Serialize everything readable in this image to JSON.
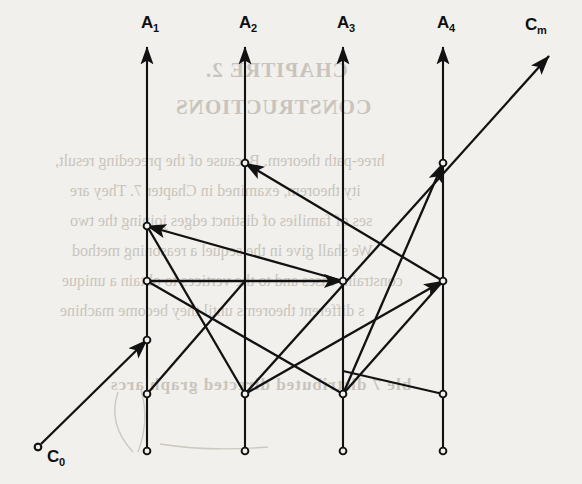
{
  "figure": {
    "background_color": "#f2f0ec",
    "ink_color": "#121212",
    "width": 582,
    "height": 484
  },
  "axes": [
    {
      "id": "A1",
      "label": "A",
      "subscript": "1",
      "x": 147,
      "label_x": 141,
      "label_y": 28,
      "top_y": 47,
      "bottom_y": 451
    },
    {
      "id": "A2",
      "label": "A",
      "subscript": "2",
      "x": 245,
      "label_x": 239,
      "label_y": 28,
      "top_y": 47,
      "bottom_y": 451
    },
    {
      "id": "A3",
      "label": "A",
      "subscript": "3",
      "x": 343,
      "label_x": 337,
      "label_y": 28,
      "top_y": 47,
      "bottom_y": 451
    },
    {
      "id": "A4",
      "label": "A",
      "subscript": "4",
      "x": 443,
      "label_x": 437,
      "label_y": 28,
      "top_y": 47,
      "bottom_y": 451
    }
  ],
  "endpoints": {
    "source": {
      "id": "C0",
      "label": "C",
      "subscript": "0",
      "x": 38,
      "y": 447,
      "label_x": 47,
      "label_y": 462
    },
    "sink": {
      "id": "Cm",
      "label": "C",
      "subscript": "m",
      "x": 553,
      "y": 52,
      "label_x": 525,
      "label_y": 30
    }
  },
  "vertices": [
    {
      "axis": "A1",
      "x": 147,
      "y": 226
    },
    {
      "axis": "A1",
      "x": 147,
      "y": 281
    },
    {
      "axis": "A1",
      "x": 147,
      "y": 340
    },
    {
      "axis": "A1",
      "x": 147,
      "y": 394
    },
    {
      "axis": "A1",
      "x": 147,
      "y": 451
    },
    {
      "axis": "A2",
      "x": 245,
      "y": 163
    },
    {
      "axis": "A2",
      "x": 245,
      "y": 394
    },
    {
      "axis": "A2",
      "x": 245,
      "y": 451
    },
    {
      "axis": "A3",
      "x": 343,
      "y": 281
    },
    {
      "axis": "A3",
      "x": 343,
      "y": 394
    },
    {
      "axis": "A3",
      "x": 343,
      "y": 451
    },
    {
      "axis": "A4",
      "x": 443,
      "y": 163
    },
    {
      "axis": "A4",
      "x": 443,
      "y": 281
    },
    {
      "axis": "A4",
      "x": 443,
      "y": 394
    },
    {
      "axis": "A4",
      "x": 443,
      "y": 451
    },
    {
      "axis": "C0",
      "x": 38,
      "y": 447
    }
  ],
  "edges": [
    {
      "id": "e-c0-a1",
      "from": "C0",
      "to": "A1",
      "x1": 41,
      "y1": 444,
      "x2": 147,
      "y2": 340,
      "arrow": true
    },
    {
      "id": "e-a3-a1-diag",
      "from": "A3",
      "to": "A1",
      "x1": 343,
      "y1": 281,
      "x2": 147,
      "y2": 226,
      "arrow": true
    },
    {
      "id": "e-a4-a2-diag",
      "from": "A4",
      "to": "A2",
      "x1": 443,
      "y1": 281,
      "x2": 245,
      "y2": 163,
      "arrow": true
    },
    {
      "id": "e-a1-a3-horiz",
      "from": "A1",
      "to": "A3",
      "x1": 147,
      "y1": 281,
      "x2": 343,
      "y2": 281,
      "arrow": true
    },
    {
      "id": "e-a2-a4-diag",
      "from": "A2",
      "to": "A4",
      "x1": 245,
      "y1": 394,
      "x2": 443,
      "y2": 281,
      "arrow": true
    },
    {
      "id": "e-a3-a4-up",
      "from": "A3",
      "to": "A4",
      "x1": 343,
      "y1": 394,
      "x2": 443,
      "y2": 163,
      "arrow": true
    },
    {
      "id": "e-a1-a3-down",
      "from": "A1",
      "to": "A3",
      "x1": 147,
      "y1": 281,
      "x2": 343,
      "y2": 394,
      "arrow": false
    },
    {
      "id": "e-a1-a2-down",
      "from": "A1",
      "to": "A2",
      "x1": 147,
      "y1": 226,
      "x2": 245,
      "y2": 394,
      "arrow": false
    },
    {
      "id": "e-a2-a1-low",
      "from": "A2",
      "to": "A1",
      "x1": 245,
      "y1": 281,
      "x2": 147,
      "y2": 394,
      "arrow": false
    },
    {
      "id": "e-a4-a3-down",
      "from": "A4",
      "to": "A3",
      "x1": 443,
      "y1": 281,
      "x2": 343,
      "y2": 394,
      "arrow": false
    },
    {
      "id": "e-a4-a4-bottom",
      "from": "A4",
      "to": "A4",
      "x1": 343,
      "y1": 371,
      "x2": 443,
      "y2": 394,
      "arrow": false
    },
    {
      "id": "e-long-cm",
      "from": "A1",
      "to": "Cm",
      "x1": 245,
      "y1": 394,
      "x2": 549,
      "y2": 56,
      "arrow": true
    }
  ],
  "background_text": [
    {
      "text": "CHAPITRE 2.",
      "x": 205,
      "y": 58,
      "size": 21,
      "heading": true
    },
    {
      "text": "CONSTRUCTIONS",
      "x": 175,
      "y": 95,
      "size": 21,
      "heading": true
    },
    {
      "text": "hree-path theorem. Because of the preceding result,",
      "x": 55,
      "y": 152,
      "size": 16,
      "heading": false
    },
    {
      "text": "ity theorem, examined in Chapter 7. They are",
      "x": 70,
      "y": 182,
      "size": 16,
      "heading": false
    },
    {
      "text": "ses of families of distinct edges joining the two",
      "x": 70,
      "y": 212,
      "size": 16,
      "heading": false
    },
    {
      "text": "We shall give in the sequel a reasoning method",
      "x": 72,
      "y": 242,
      "size": 16,
      "heading": false
    },
    {
      "text": "constraint cases and to the vertices to obtain a unique",
      "x": 62,
      "y": 272,
      "size": 16,
      "heading": false
    },
    {
      "text": "s different theorems until they become machine",
      "x": 60,
      "y": 302,
      "size": 16,
      "heading": false
    },
    {
      "text": "ble 7 distributed directed graph arcs",
      "x": 110,
      "y": 375,
      "size": 17,
      "heading": true
    }
  ]
}
